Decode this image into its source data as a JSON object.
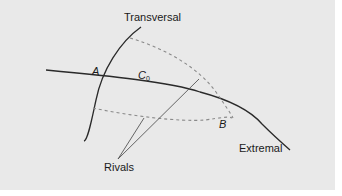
{
  "diagram": {
    "labels": {
      "transversal": "Transversal",
      "point_a": "A",
      "curve_c": "C",
      "curve_c_sub": "0",
      "point_b": "B",
      "rivals": "Rivals",
      "extremal": "Extremal"
    },
    "colors": {
      "background": "#e9e9e9",
      "stroke_solid": "#2a2a2a",
      "stroke_dashed": "#8a8a8a",
      "stroke_rival": "#555555"
    }
  }
}
